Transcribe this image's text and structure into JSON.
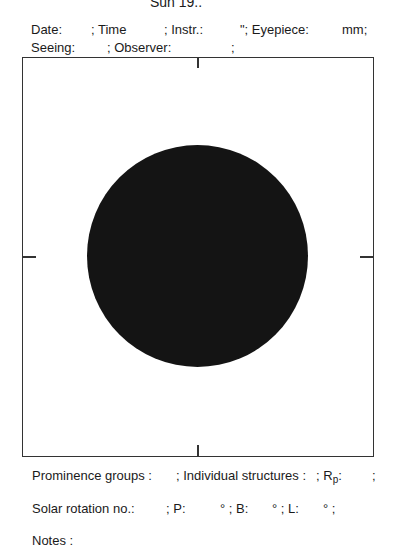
{
  "header": {
    "title": "Sun 19..",
    "row1": {
      "date_label": "Date:",
      "time_label": "; Time",
      "instr_label": "; Instr.:",
      "eyepiece_label": "\"; Eyepiece:",
      "mm_label": "mm;"
    },
    "row2": {
      "seeing_label": "Seeing:",
      "observer_label": "; Observer:",
      "end_sep": ";"
    }
  },
  "drawing": {
    "frame_color": "#333333",
    "sun_disk_color": "#141414"
  },
  "footer": {
    "row1": {
      "prominence_label": "Prominence groups :",
      "individual_label": "; Individual structures :",
      "rp_label": "; R",
      "rp_sub": "p",
      "rp_colon": ":",
      "end_sep": ";"
    },
    "row2": {
      "rotation_label": "Solar rotation no.:",
      "p_label": "; P:",
      "b_label": "° ; B:",
      "l_label": "° ; L:",
      "end_label": "° ;"
    },
    "row3": {
      "notes_label": "Notes :"
    }
  }
}
